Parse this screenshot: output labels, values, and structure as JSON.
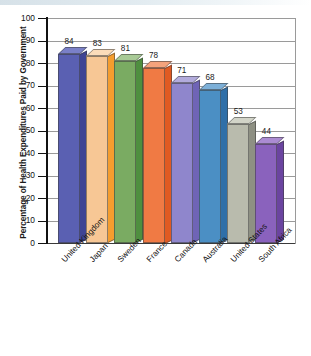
{
  "chart_data": {
    "type": "bar",
    "title": "",
    "xlabel": "",
    "ylabel": "Percentage of Health Expenditures Paid by Government",
    "categories": [
      "United Kingdom",
      "Japan",
      "Sweden",
      "France",
      "Canada",
      "Australia",
      "United States",
      "South Africa"
    ],
    "values": [
      84,
      83,
      81,
      78,
      71,
      68,
      53,
      44
    ],
    "ylim": [
      0,
      100
    ],
    "y_ticks": [
      0,
      10,
      20,
      30,
      40,
      50,
      60,
      70,
      80,
      90,
      100
    ],
    "y_tick_labels": [
      "0",
      "10",
      "20",
      "30",
      "40",
      "50",
      "60",
      "70",
      "80",
      "90",
      "100"
    ],
    "grid": true,
    "legend": "none",
    "style": "3d-column",
    "bar_colors": [
      {
        "front": "#5a60b2",
        "side": "#3f4494",
        "top": "#7a80c8"
      },
      {
        "front": "#f7c795",
        "side": "#f59d2e",
        "top": "#fbdcba"
      },
      {
        "front": "#7aab62",
        "side": "#4f8f3f",
        "top": "#a8ca96"
      },
      {
        "front": "#f07a44",
        "side": "#e05a22",
        "top": "#f5a37c"
      },
      {
        "front": "#8f86cc",
        "side": "#6f64b6",
        "top": "#b2abdc"
      },
      {
        "front": "#4b8fc4",
        "side": "#2f6fa8",
        "top": "#7db0d8"
      },
      {
        "front": "#b9bbad",
        "side": "#8e9083",
        "top": "#d2d4c8"
      },
      {
        "front": "#8a62bd",
        "side": "#6b44a0",
        "top": "#ab8bd2"
      }
    ],
    "axis_color": "#111111",
    "gridline_color": "#9a9a9a",
    "background": "#ffffff"
  }
}
